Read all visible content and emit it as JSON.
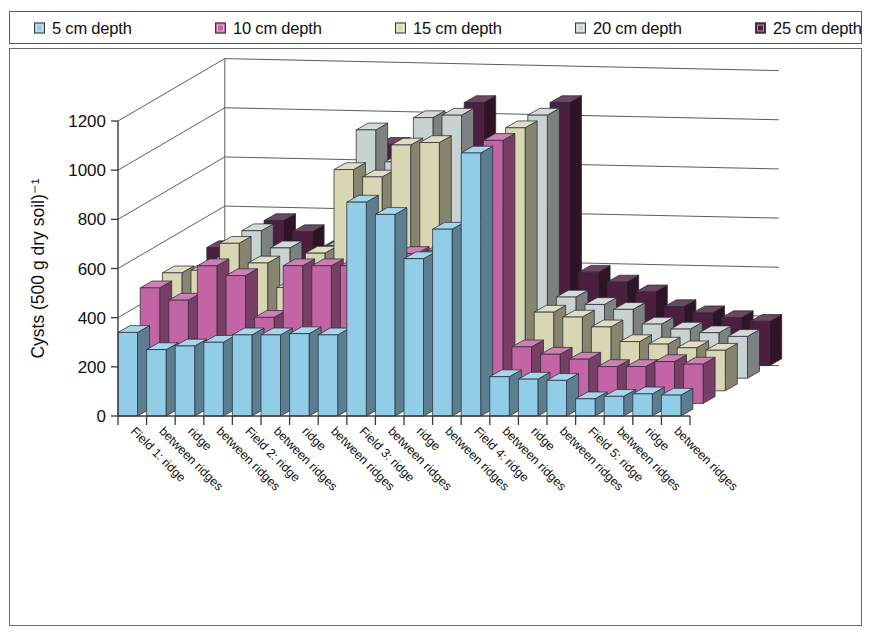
{
  "legend": {
    "items": [
      {
        "label": "5 cm depth",
        "color": "#92CDE8",
        "swatch_name": "legend-swatch-5cm"
      },
      {
        "label": "10 cm depth",
        "color": "#C364A4",
        "swatch_name": "legend-swatch-10cm"
      },
      {
        "label": "15 cm depth",
        "color": "#D9D6B4",
        "swatch_name": "legend-swatch-15cm"
      },
      {
        "label": "20 cm depth",
        "color": "#C8D2D2",
        "swatch_name": "legend-swatch-20cm"
      },
      {
        "label": "25 cm depth",
        "color": "#4B1F3D",
        "swatch_name": "legend-swatch-25cm"
      }
    ]
  },
  "chart_data": {
    "type": "bar",
    "subtype": "3d-grouped-bar",
    "title": "",
    "xlabel": "",
    "ylabel": "Cysts (500 g dry soil)⁻¹",
    "ylim": [
      0,
      1200
    ],
    "yticks": [
      0,
      200,
      400,
      600,
      800,
      1000,
      1200
    ],
    "ytick_labels": [
      "0",
      "200",
      "400",
      "600",
      "800",
      "1000",
      "1200"
    ],
    "grid": true,
    "legend_position": "top",
    "categories": [
      "Field 1: ridge",
      "between ridges",
      "ridge",
      "between ridges",
      "Field 2: ridge",
      "between ridges",
      "ridge",
      "between ridges",
      "Field 3: ridge",
      "between ridges",
      "ridge",
      "between ridges",
      "Field 4: ridge",
      "between ridges",
      "ridge",
      "between ridges",
      "Field 5: ridge",
      "between ridges",
      "ridge",
      "between ridges"
    ],
    "series": [
      {
        "name": "5 cm depth",
        "color": "#92CDE8",
        "values": [
          340,
          270,
          285,
          300,
          330,
          330,
          335,
          330,
          870,
          820,
          640,
          760,
          1070,
          160,
          150,
          145,
          70,
          80,
          90,
          85
        ]
      },
      {
        "name": "10 cm depth",
        "color": "#C364A4",
        "values": [
          470,
          420,
          560,
          520,
          350,
          560,
          560,
          560,
          620,
          610,
          620,
          620,
          1070,
          230,
          200,
          180,
          150,
          150,
          170,
          160
        ]
      },
      {
        "name": "15 cm depth",
        "color": "#D9D6B4",
        "values": [
          480,
          490,
          600,
          520,
          420,
          560,
          900,
          870,
          1000,
          1010,
          620,
          620,
          1070,
          320,
          300,
          260,
          200,
          190,
          175,
          165
        ]
      },
      {
        "name": "20 cm depth",
        "color": "#C8D2D2",
        "values": [
          430,
          480,
          600,
          530,
          400,
          540,
          1010,
          880,
          1060,
          1070,
          620,
          620,
          1070,
          330,
          300,
          280,
          220,
          200,
          185,
          170
        ]
      },
      {
        "name": "25 cm depth",
        "color": "#4B1F3D",
        "values": [
          480,
          470,
          590,
          545,
          480,
          520,
          900,
          880,
          940,
          1070,
          620,
          620,
          1070,
          380,
          340,
          300,
          240,
          215,
          195,
          180
        ]
      }
    ]
  }
}
